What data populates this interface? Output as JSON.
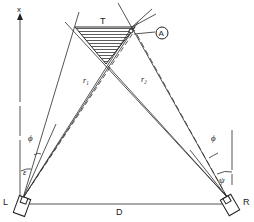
{
  "diagram": {
    "axis_label": "x",
    "target_label": "T",
    "point_label": "A",
    "range_left_label": "r₁",
    "range_right_label": "r₂",
    "angle_phi_left": "ϕ",
    "angle_phi_right": "ϕ",
    "angle_epsilon": "ε",
    "angle_psi": "ψ",
    "left_sensor_label": "L",
    "right_sensor_label": "R",
    "baseline_label": "D",
    "colors": {
      "line": "#2a2a2a",
      "background": "#ffffff"
    }
  }
}
